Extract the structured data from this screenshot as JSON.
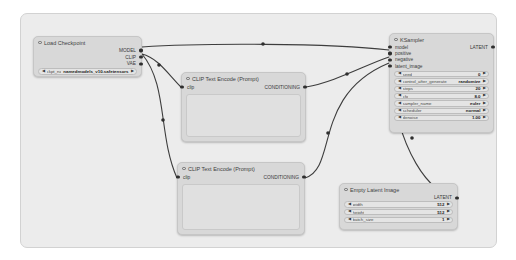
{
  "app": "node-graph-editor",
  "colors": {
    "canvas_bg": "#ececec",
    "node_bg": "#d8d8d8",
    "widget_bg": "#e4e4e4",
    "wire": "#3d3d3d",
    "slot_dot": "#2f2f2f"
  },
  "nodes": {
    "load_checkpoint": {
      "title": "Load Checkpoint",
      "outputs": {
        "model": "MODEL",
        "clip": "CLIP",
        "vae": "VAE"
      },
      "widget": {
        "label": "ckpt_name",
        "value": "namedmodels_v10.safetensors"
      }
    },
    "clip_text_encode_positive": {
      "title": "CLIP Text Encode (Prompt)",
      "input": "clip",
      "output": "CONDITIONING",
      "text": ""
    },
    "clip_text_encode_negative": {
      "title": "CLIP Text Encode (Prompt)",
      "input": "clip",
      "output": "CONDITIONING",
      "text": ""
    },
    "ksampler": {
      "title": "KSampler",
      "inputs": {
        "model": "model",
        "positive": "positive",
        "negative": "negative",
        "latent": "latent_image"
      },
      "output": "LATENT",
      "widgets": [
        {
          "label": "seed",
          "value": "0"
        },
        {
          "label": "control_after_generate",
          "value": "randomize"
        },
        {
          "label": "steps",
          "value": "20"
        },
        {
          "label": "cfg",
          "value": "8.0"
        },
        {
          "label": "sampler_name",
          "value": "euler"
        },
        {
          "label": "scheduler",
          "value": "normal"
        },
        {
          "label": "denoise",
          "value": "1.00"
        }
      ]
    },
    "empty_latent_image": {
      "title": "Empty Latent Image",
      "output": "LATENT",
      "widgets": [
        {
          "label": "width",
          "value": "512"
        },
        {
          "label": "height",
          "value": "512"
        },
        {
          "label": "batch_size",
          "value": "1"
        }
      ]
    }
  },
  "glyphs": {
    "dec_arrow": "◀",
    "inc_arrow": "▶"
  }
}
